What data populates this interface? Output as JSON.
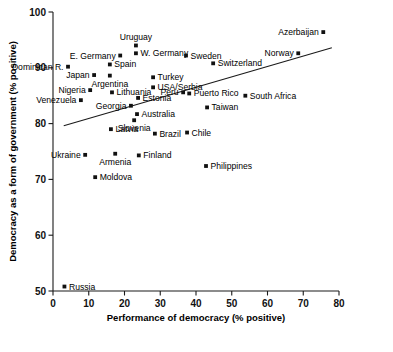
{
  "chart_data": {
    "type": "scatter",
    "title": "",
    "xlabel": "Performance of democracy (% positive)",
    "ylabel": "Democracy as a form of government (% positive)",
    "xlim": [
      0,
      80
    ],
    "ylim": [
      50,
      100
    ],
    "xticks": [
      0,
      10,
      20,
      30,
      40,
      50,
      60,
      70,
      80
    ],
    "yticks": [
      50,
      60,
      70,
      80,
      90,
      100
    ],
    "grid": false,
    "legend": null,
    "trendline": {
      "x": [
        3.0,
        78.0
      ],
      "y": [
        79.6,
        93.6
      ],
      "label": "regression-line"
    },
    "points": [
      {
        "label": "Uruguay",
        "x": 23.2,
        "y": 94.0,
        "label_pos": "above"
      },
      {
        "label": "W. Germany",
        "x": 23.2,
        "y": 92.6,
        "label_pos": "right"
      },
      {
        "label": "E. Germany",
        "x": 18.8,
        "y": 92.2,
        "label_pos": "left"
      },
      {
        "label": "Sweden",
        "x": 37.2,
        "y": 92.2,
        "label_pos": "right"
      },
      {
        "label": "Norway",
        "x": 68.6,
        "y": 92.6,
        "label_pos": "left"
      },
      {
        "label": "Azerbaijan",
        "x": 75.6,
        "y": 96.4,
        "label_pos": "left"
      },
      {
        "label": "Dominican R.",
        "x": 4.2,
        "y": 90.2,
        "label_pos": "left"
      },
      {
        "label": "Spain",
        "x": 15.9,
        "y": 90.6,
        "label_pos": "right"
      },
      {
        "label": "Switzerland",
        "x": 44.8,
        "y": 90.8,
        "label_pos": "right"
      },
      {
        "label": "Japan",
        "x": 11.5,
        "y": 88.7,
        "label_pos": "left"
      },
      {
        "label": "Argentina",
        "x": 15.9,
        "y": 88.6,
        "label_pos": "below"
      },
      {
        "label": "Turkey",
        "x": 28.0,
        "y": 88.3,
        "label_pos": "right"
      },
      {
        "label": "USA/Serbia",
        "x": 28.0,
        "y": 86.5,
        "label_pos": "right"
      },
      {
        "label": "Nigeria",
        "x": 10.4,
        "y": 86.0,
        "label_pos": "left"
      },
      {
        "label": "Lithuania",
        "x": 16.5,
        "y": 85.6,
        "label_pos": "right"
      },
      {
        "label": "Peru",
        "x": 36.4,
        "y": 85.6,
        "label_pos": "left"
      },
      {
        "label": "Puerto Rico",
        "x": 38.1,
        "y": 85.4,
        "label_pos": "right"
      },
      {
        "label": "Estonia",
        "x": 23.8,
        "y": 84.6,
        "label_pos": "right"
      },
      {
        "label": "South Africa",
        "x": 53.8,
        "y": 85.0,
        "label_pos": "right"
      },
      {
        "label": "Venezuela",
        "x": 7.8,
        "y": 84.2,
        "label_pos": "left"
      },
      {
        "label": "Georgia",
        "x": 21.8,
        "y": 83.2,
        "label_pos": "left"
      },
      {
        "label": "Taiwan",
        "x": 43.1,
        "y": 82.9,
        "label_pos": "right"
      },
      {
        "label": "Australia",
        "x": 23.5,
        "y": 81.7,
        "label_pos": "right"
      },
      {
        "label": "Slovenia",
        "x": 22.7,
        "y": 80.6,
        "label_pos": "below"
      },
      {
        "label": "Latvia",
        "x": 16.2,
        "y": 79.0,
        "label_pos": "right"
      },
      {
        "label": "Brazil",
        "x": 28.5,
        "y": 78.2,
        "label_pos": "right"
      },
      {
        "label": "Chile",
        "x": 37.5,
        "y": 78.4,
        "label_pos": "right"
      },
      {
        "label": "Ukraine",
        "x": 9.0,
        "y": 74.4,
        "label_pos": "left"
      },
      {
        "label": "Armenia",
        "x": 17.4,
        "y": 74.6,
        "label_pos": "below"
      },
      {
        "label": "Finland",
        "x": 24.0,
        "y": 74.3,
        "label_pos": "right"
      },
      {
        "label": "Philippines",
        "x": 42.8,
        "y": 72.4,
        "label_pos": "right"
      },
      {
        "label": "Moldova",
        "x": 11.8,
        "y": 70.4,
        "label_pos": "right"
      },
      {
        "label": "Russia",
        "x": 3.2,
        "y": 50.8,
        "label_pos": "right"
      }
    ]
  }
}
